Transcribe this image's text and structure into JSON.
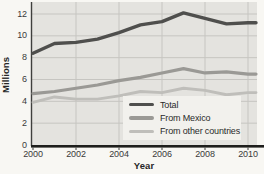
{
  "chart_data": {
    "type": "line",
    "title": "",
    "xlabel": "Year",
    "ylabel": "Millions",
    "x": [
      2000,
      2001,
      2002,
      2003,
      2004,
      2005,
      2006,
      2007,
      2008,
      2009,
      2010
    ],
    "xtick_labels": [
      "2000",
      "2002",
      "2004",
      "2006",
      "2008",
      "2010"
    ],
    "ytick_labels": [
      "0",
      "2",
      "4",
      "6",
      "8",
      "10",
      "12"
    ],
    "xlim": [
      2000,
      2010
    ],
    "ylim": [
      0,
      13.1
    ],
    "grid": true,
    "legend_position": "bottom-right-inside",
    "series": [
      {
        "name": "Total",
        "color": "#4f4f4d",
        "values": [
          8.4,
          9.3,
          9.4,
          9.7,
          10.3,
          11.0,
          11.3,
          12.1,
          11.6,
          11.1,
          11.2
        ]
      },
      {
        "name": "From Mexico",
        "color": "#9a9995",
        "values": [
          4.7,
          4.9,
          5.2,
          5.5,
          5.9,
          6.2,
          6.6,
          7.0,
          6.6,
          6.7,
          6.5
        ]
      },
      {
        "name": "From other countries",
        "color": "#bfbeba",
        "values": [
          3.9,
          4.4,
          4.2,
          4.2,
          4.5,
          4.9,
          4.8,
          5.2,
          5.0,
          4.6,
          4.8
        ]
      }
    ],
    "colors": {
      "page_bg": "#f8f7f3",
      "plot_bg": "#e4e3df",
      "gridline": "#c6c5c1",
      "axis": "#3f3f3d",
      "baseline": "#1e1e1c",
      "legend_bg": "#f2f1ed",
      "text": "#3a3a3a"
    }
  }
}
